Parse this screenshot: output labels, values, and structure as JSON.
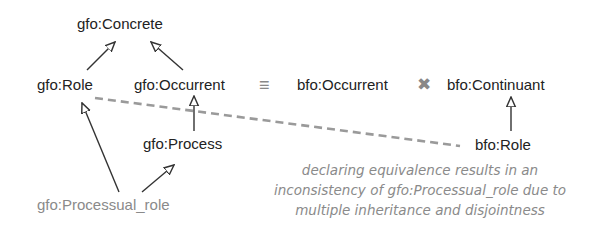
{
  "nodes": {
    "gfo_concrete": "gfo:Concrete",
    "gfo_role": "gfo:Role",
    "gfo_occurrent": "gfo:Occurrent",
    "bfo_occurrent": "bfo:Occurrent",
    "bfo_continuant": "bfo:Continuant",
    "gfo_process": "gfo:Process",
    "bfo_role": "bfo:Role",
    "gfo_processual_role": "gfo:Processual_role"
  },
  "symbols": {
    "equivalence": "≡",
    "disjoint": "✖"
  },
  "edges": [
    {
      "from": "gfo:Role",
      "to": "gfo:Concrete",
      "type": "subclass"
    },
    {
      "from": "gfo:Occurrent",
      "to": "gfo:Concrete",
      "type": "subclass"
    },
    {
      "from": "gfo:Process",
      "to": "gfo:Occurrent",
      "type": "subclass"
    },
    {
      "from": "bfo:Role",
      "to": "bfo:Continuant",
      "type": "subclass"
    },
    {
      "from": "gfo:Processual_role",
      "to": "gfo:Role",
      "type": "subclass"
    },
    {
      "from": "gfo:Processual_role",
      "to": "gfo:Process",
      "type": "subclass"
    },
    {
      "from": "gfo:Role",
      "to": "bfo:Role",
      "type": "equivalence-declared",
      "style": "dashed"
    },
    {
      "from": "gfo:Occurrent",
      "to": "bfo:Occurrent",
      "type": "equivalent"
    },
    {
      "from": "bfo:Occurrent",
      "to": "bfo:Continuant",
      "type": "disjoint"
    }
  ],
  "note": {
    "lines": [
      "declaring equivalence results in an",
      "inconsistency of gfo:Processual_role due to",
      "multiple inheritance and disjointness"
    ]
  },
  "colors": {
    "text": "#222222",
    "gray": "#8a8a8a",
    "dashed": "#9a9a9a",
    "line": "#333333"
  }
}
